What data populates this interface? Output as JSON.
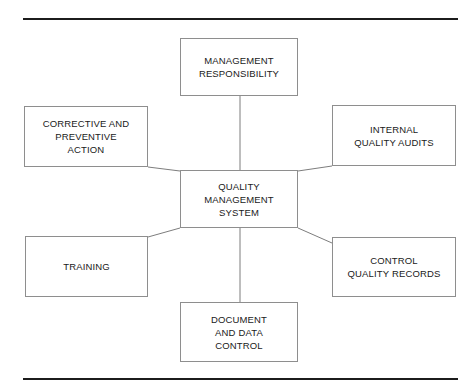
{
  "diagram": {
    "title": "Quality Management System",
    "type": "hub-and-spoke",
    "rules": {
      "top_label": "top-horizontal-rule",
      "bottom_label": "bottom-horizontal-rule"
    },
    "center": {
      "id": "quality-management-system",
      "label": "QUALITY\nMANAGEMENT\nSYSTEM"
    },
    "nodes": [
      {
        "id": "management-responsibility",
        "label": "MANAGEMENT\nRESPONSIBILITY",
        "position": "top"
      },
      {
        "id": "corrective-preventive-action",
        "label": "CORRECTIVE AND\nPREVENTIVE\nACTION",
        "position": "top-left"
      },
      {
        "id": "internal-quality-audits",
        "label": "INTERNAL\nQUALITY AUDITS",
        "position": "top-right"
      },
      {
        "id": "training",
        "label": "TRAINING",
        "position": "bottom-left"
      },
      {
        "id": "control-quality-records",
        "label": "CONTROL\nQUALITY RECORDS",
        "position": "bottom-right"
      },
      {
        "id": "document-data-control",
        "label": "DOCUMENT\nAND DATA\nCONTROL",
        "position": "bottom"
      }
    ],
    "connectors": [
      {
        "id": "center-to-management-responsibility",
        "from": "quality-management-system",
        "to": "management-responsibility"
      },
      {
        "id": "center-to-corrective-preventive-action",
        "from": "quality-management-system",
        "to": "corrective-preventive-action"
      },
      {
        "id": "center-to-internal-quality-audits",
        "from": "quality-management-system",
        "to": "internal-quality-audits"
      },
      {
        "id": "center-to-training",
        "from": "quality-management-system",
        "to": "training"
      },
      {
        "id": "center-to-control-quality-records",
        "from": "quality-management-system",
        "to": "control-quality-records"
      },
      {
        "id": "center-to-document-data-control",
        "from": "quality-management-system",
        "to": "document-data-control"
      }
    ],
    "colors": {
      "page_background": "#ffffff",
      "rule": "#1c1c1c",
      "box_border": "#8e8e8e",
      "connector": "#7d7d7d",
      "text": "#1a1a1a"
    }
  }
}
